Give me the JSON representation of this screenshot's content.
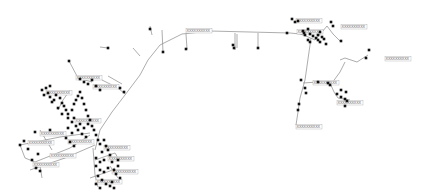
{
  "diagram": {
    "type": "network-map",
    "background": "#ffffff",
    "edge_color": "#8a8a8a",
    "node_color": "#111111",
    "label_text": "XXXXXXXXXX",
    "edges": [
      [
        [
          95,
          150
        ],
        [
          100,
          130
        ],
        [
          112,
          112
        ],
        [
          125,
          95
        ],
        [
          140,
          75
        ],
        [
          148,
          60
        ],
        [
          160,
          45
        ],
        [
          182,
          34
        ],
        [
          210,
          31
        ],
        [
          250,
          32
        ],
        [
          290,
          33
        ],
        [
          300,
          34
        ]
      ],
      [
        [
          300,
          34
        ],
        [
          306,
          36
        ],
        [
          315,
          40
        ]
      ],
      [
        [
          315,
          40
        ],
        [
          322,
          32
        ],
        [
          327,
          26
        ]
      ],
      [
        [
          327,
          26
        ],
        [
          333,
          34
        ],
        [
          340,
          41
        ]
      ],
      [
        [
          311,
          38
        ],
        [
          305,
          80
        ],
        [
          300,
          98
        ],
        [
          298,
          112
        ],
        [
          296,
          125
        ]
      ],
      [
        [
          296,
          125
        ],
        [
          300,
          126
        ]
      ],
      [
        [
          303,
          83
        ],
        [
          318,
          82
        ],
        [
          330,
          83
        ]
      ],
      [
        [
          330,
          83
        ],
        [
          334,
          92
        ],
        [
          338,
          98
        ]
      ],
      [
        [
          338,
          98
        ],
        [
          350,
          100
        ]
      ],
      [
        [
          345,
          62
        ],
        [
          340,
          72
        ],
        [
          332,
          83
        ]
      ],
      [
        [
          357,
          62
        ],
        [
          345,
          58
        ],
        [
          340,
          60
        ]
      ],
      [
        [
          357,
          62
        ],
        [
          368,
          55
        ]
      ],
      [
        [
          150,
          26
        ],
        [
          152,
          35
        ]
      ],
      [
        [
          162,
          30
        ],
        [
          163,
          52
        ]
      ],
      [
        [
          235,
          33
        ],
        [
          235,
          50
        ]
      ],
      [
        [
          258,
          33
        ],
        [
          258,
          48
        ]
      ],
      [
        [
          186,
          34
        ],
        [
          187,
          49
        ]
      ],
      [
        [
          237,
          34
        ],
        [
          237,
          48
        ]
      ],
      [
        [
          100,
          47
        ],
        [
          108,
          48
        ]
      ],
      [
        [
          133,
          48
        ],
        [
          140,
          56
        ]
      ],
      [
        [
          69,
          61
        ],
        [
          78,
          78
        ],
        [
          92,
          82
        ]
      ],
      [
        [
          108,
          76
        ],
        [
          122,
          84
        ]
      ],
      [
        [
          102,
          80
        ],
        [
          118,
          88
        ],
        [
          125,
          94
        ]
      ],
      [
        [
          70,
          90
        ],
        [
          63,
          100
        ],
        [
          58,
          110
        ]
      ],
      [
        [
          40,
          130
        ],
        [
          52,
          150
        ]
      ],
      [
        [
          20,
          145
        ],
        [
          60,
          137
        ],
        [
          90,
          133
        ]
      ],
      [
        [
          20,
          145
        ],
        [
          25,
          158
        ],
        [
          35,
          162
        ]
      ],
      [
        [
          35,
          162
        ],
        [
          70,
          148
        ],
        [
          90,
          135
        ]
      ],
      [
        [
          30,
          170
        ],
        [
          65,
          158
        ],
        [
          95,
          145
        ]
      ],
      [
        [
          40,
          166
        ],
        [
          42,
          178
        ]
      ],
      [
        [
          93,
          148
        ],
        [
          95,
          175
        ],
        [
          98,
          187
        ]
      ],
      [
        [
          95,
          160
        ],
        [
          115,
          153
        ],
        [
          118,
          158
        ]
      ],
      [
        [
          110,
          166
        ],
        [
          118,
          178
        ]
      ],
      [
        [
          90,
          178
        ],
        [
          110,
          171
        ],
        [
          115,
          168
        ]
      ]
    ],
    "nodes": [
      [
        69,
        61
      ],
      [
        150,
        29
      ],
      [
        163,
        52
      ],
      [
        186,
        49
      ],
      [
        108,
        48
      ],
      [
        233,
        45
      ],
      [
        234,
        48
      ],
      [
        258,
        48
      ],
      [
        287,
        33
      ],
      [
        292,
        19
      ],
      [
        295,
        22
      ],
      [
        298,
        21
      ],
      [
        303,
        31
      ],
      [
        304,
        33
      ],
      [
        305,
        35
      ],
      [
        308,
        29
      ],
      [
        310,
        34
      ],
      [
        313,
        36
      ],
      [
        316,
        38
      ],
      [
        318,
        40
      ],
      [
        320,
        42
      ],
      [
        322,
        37
      ],
      [
        324,
        39
      ],
      [
        326,
        44
      ],
      [
        310,
        42
      ],
      [
        308,
        40
      ],
      [
        318,
        35
      ],
      [
        320,
        32
      ],
      [
        331,
        22
      ],
      [
        333,
        26
      ],
      [
        341,
        41
      ],
      [
        369,
        50
      ],
      [
        366,
        58
      ],
      [
        301,
        80
      ],
      [
        305,
        88
      ],
      [
        306,
        93
      ],
      [
        318,
        82
      ],
      [
        328,
        83
      ],
      [
        330,
        85
      ],
      [
        337,
        94
      ],
      [
        341,
        97
      ],
      [
        345,
        99
      ],
      [
        347,
        101
      ],
      [
        345,
        106
      ],
      [
        341,
        90
      ],
      [
        346,
        92
      ],
      [
        299,
        104
      ],
      [
        298,
        110
      ],
      [
        42,
        90
      ],
      [
        48,
        93
      ],
      [
        50,
        97
      ],
      [
        54,
        100
      ],
      [
        56,
        95
      ],
      [
        60,
        98
      ],
      [
        62,
        103
      ],
      [
        64,
        106
      ],
      [
        66,
        110
      ],
      [
        68,
        114
      ],
      [
        72,
        110
      ],
      [
        74,
        104
      ],
      [
        76,
        100
      ],
      [
        78,
        96
      ],
      [
        80,
        92
      ],
      [
        82,
        98
      ],
      [
        84,
        104
      ],
      [
        86,
        110
      ],
      [
        88,
        116
      ],
      [
        74,
        118
      ],
      [
        72,
        122
      ],
      [
        76,
        126
      ],
      [
        80,
        124
      ],
      [
        84,
        128
      ],
      [
        78,
        130
      ],
      [
        82,
        134
      ],
      [
        86,
        137
      ],
      [
        68,
        128
      ],
      [
        72,
        133
      ],
      [
        66,
        138
      ],
      [
        70,
        142
      ],
      [
        74,
        146
      ],
      [
        90,
        120
      ],
      [
        92,
        126
      ],
      [
        94,
        130
      ],
      [
        88,
        124
      ],
      [
        46,
        88
      ],
      [
        50,
        86
      ],
      [
        44,
        95
      ],
      [
        52,
        102
      ],
      [
        58,
        108
      ],
      [
        62,
        114
      ],
      [
        68,
        118
      ],
      [
        35,
        132
      ],
      [
        50,
        130
      ],
      [
        24,
        141
      ],
      [
        20,
        145
      ],
      [
        28,
        149
      ],
      [
        38,
        154
      ],
      [
        32,
        160
      ],
      [
        36,
        168
      ],
      [
        40,
        171
      ],
      [
        96,
        135
      ],
      [
        98,
        140
      ],
      [
        100,
        144
      ],
      [
        104,
        140
      ],
      [
        106,
        146
      ],
      [
        108,
        150
      ],
      [
        102,
        152
      ],
      [
        96,
        158
      ],
      [
        100,
        162
      ],
      [
        104,
        160
      ],
      [
        110,
        155
      ],
      [
        96,
        166
      ],
      [
        100,
        170
      ],
      [
        104,
        172
      ],
      [
        108,
        168
      ],
      [
        112,
        162
      ],
      [
        114,
        170
      ],
      [
        98,
        176
      ],
      [
        102,
        180
      ],
      [
        106,
        184
      ],
      [
        96,
        184
      ],
      [
        100,
        188
      ],
      [
        118,
        160
      ],
      [
        118,
        166
      ],
      [
        116,
        174
      ],
      [
        120,
        178
      ],
      [
        112,
        182
      ],
      [
        110,
        186
      ],
      [
        114,
        188
      ],
      [
        120,
        88
      ],
      [
        124,
        92
      ],
      [
        80,
        79
      ],
      [
        84,
        82
      ],
      [
        88,
        84
      ],
      [
        92,
        80
      ],
      [
        96,
        86
      ],
      [
        100,
        90
      ]
    ],
    "labels": [
      {
        "x": 186,
        "y": 32,
        "text": "XXXXXXXXXX"
      },
      {
        "x": 296,
        "y": 22,
        "text": "XXXXXXXXXX"
      },
      {
        "x": 297,
        "y": 33,
        "text": "XXXXXXXXXX"
      },
      {
        "x": 341,
        "y": 28,
        "text": "XXXXXXXXXX"
      },
      {
        "x": 385,
        "y": 60,
        "text": "XXXXXXXXXX"
      },
      {
        "x": 313,
        "y": 84,
        "text": "XXXXXXXXXX"
      },
      {
        "x": 337,
        "y": 104,
        "text": "XXXXXXXXXX"
      },
      {
        "x": 296,
        "y": 128,
        "text": "XXXXXXXXXX"
      },
      {
        "x": 76,
        "y": 79,
        "text": "XXXXXXXXXX"
      },
      {
        "x": 93,
        "y": 88,
        "text": "XXXXXXXXXX"
      },
      {
        "x": 46,
        "y": 94,
        "text": "XXXXXXXXXX"
      },
      {
        "x": 75,
        "y": 122,
        "text": "XXXXXXXXXX"
      },
      {
        "x": 40,
        "y": 135,
        "text": "XXXXXXXXXX"
      },
      {
        "x": 28,
        "y": 144,
        "text": "XXXXXXXXXX"
      },
      {
        "x": 50,
        "y": 157,
        "text": "XXXXXXXXXX"
      },
      {
        "x": 68,
        "y": 143,
        "text": "XXXXXXXXXX"
      },
      {
        "x": 33,
        "y": 166,
        "text": "XXXXXXXXXX"
      },
      {
        "x": 104,
        "y": 149,
        "text": "XXXXXXXXXX"
      },
      {
        "x": 108,
        "y": 160,
        "text": "XXXXXXXXXX"
      },
      {
        "x": 112,
        "y": 173,
        "text": "XXXXXXXXXX"
      },
      {
        "x": 96,
        "y": 183,
        "text": "XXXXXXXXXX"
      }
    ]
  }
}
